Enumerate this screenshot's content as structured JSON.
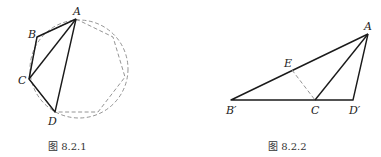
{
  "figures": [
    {
      "id": "fig-8-2-1",
      "caption": "图 8.2.1",
      "labels": {
        "A": "A",
        "B": "B",
        "C": "C",
        "D": "D"
      },
      "points": {
        "A": [
          76,
          19
        ],
        "B": [
          37,
          37
        ],
        "C": [
          29,
          79
        ],
        "D": [
          55,
          112
        ]
      },
      "circle": {
        "cx": 79,
        "cy": 69,
        "r": 49
      },
      "polygon_vertices": [
        [
          76,
          19
        ],
        [
          113,
          37
        ],
        [
          125,
          77
        ],
        [
          98,
          112
        ],
        [
          55,
          112
        ],
        [
          29,
          79
        ],
        [
          37,
          37
        ]
      ],
      "solid_segments": [
        "AB",
        "BC",
        "CD",
        "DA",
        "CA"
      ]
    },
    {
      "id": "fig-8-2-2",
      "caption": "图 8.2.2",
      "labels": {
        "A": "A",
        "B'": "B′",
        "C": "C",
        "D'": "D′",
        "E": "E"
      },
      "points": {
        "A": [
          368,
          34
        ],
        "B'": [
          231,
          100
        ],
        "C": [
          315,
          100
        ],
        "D'": [
          353,
          100
        ],
        "E": [
          292,
          70
        ]
      },
      "solid_segments": [
        "AB'",
        "B'D'",
        "D'A",
        "AC"
      ],
      "dashed_segments": [
        "EC"
      ]
    }
  ]
}
